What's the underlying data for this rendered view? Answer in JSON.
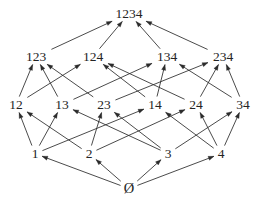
{
  "diagram": {
    "type": "lattice-hasse-diagram",
    "background_color": "#ffffff",
    "line_color": "#2b2b2b",
    "text_color": "#242424",
    "levels": [
      {
        "rank": 4,
        "y": 18
      },
      {
        "rank": 3,
        "y": 61
      },
      {
        "rank": 2,
        "y": 109
      },
      {
        "rank": 1,
        "y": 158
      },
      {
        "rank": 0,
        "y": 193
      }
    ],
    "nodes": [
      {
        "id": "1234",
        "label": "1234",
        "x": 129,
        "y": 18,
        "rank": 4,
        "halfw": 17,
        "icon": "text-label"
      },
      {
        "id": "123",
        "label": "123",
        "x": 36,
        "y": 61,
        "rank": 3,
        "halfw": 13,
        "icon": "text-label"
      },
      {
        "id": "124",
        "label": "124",
        "x": 93,
        "y": 61,
        "rank": 3,
        "halfw": 13,
        "icon": "text-label"
      },
      {
        "id": "134",
        "label": "134",
        "x": 167,
        "y": 61,
        "rank": 3,
        "halfw": 13,
        "icon": "text-label"
      },
      {
        "id": "234",
        "label": "234",
        "x": 223,
        "y": 61,
        "rank": 3,
        "halfw": 13,
        "icon": "text-label"
      },
      {
        "id": "12",
        "label": "12",
        "x": 16,
        "y": 109,
        "rank": 2,
        "halfw": 9,
        "icon": "text-label"
      },
      {
        "id": "13",
        "label": "13",
        "x": 62,
        "y": 109,
        "rank": 2,
        "halfw": 9,
        "icon": "text-label"
      },
      {
        "id": "23",
        "label": "23",
        "x": 104,
        "y": 109,
        "rank": 2,
        "halfw": 9,
        "icon": "text-label"
      },
      {
        "id": "14",
        "label": "14",
        "x": 155,
        "y": 109,
        "rank": 2,
        "halfw": 9,
        "icon": "text-label"
      },
      {
        "id": "24",
        "label": "24",
        "x": 196,
        "y": 109,
        "rank": 2,
        "halfw": 9,
        "icon": "text-label"
      },
      {
        "id": "34",
        "label": "34",
        "x": 243,
        "y": 109,
        "rank": 2,
        "halfw": 9,
        "icon": "text-label"
      },
      {
        "id": "1",
        "label": "1",
        "x": 35,
        "y": 158,
        "rank": 1,
        "halfw": 5,
        "icon": "text-label"
      },
      {
        "id": "2",
        "label": "2",
        "x": 89,
        "y": 158,
        "rank": 1,
        "halfw": 5,
        "icon": "text-label"
      },
      {
        "id": "3",
        "label": "3",
        "x": 168,
        "y": 158,
        "rank": 1,
        "halfw": 5,
        "icon": "text-label"
      },
      {
        "id": "4",
        "label": "4",
        "x": 221,
        "y": 158,
        "rank": 1,
        "halfw": 5,
        "icon": "text-label"
      },
      {
        "id": "empty",
        "label": "Ø",
        "x": 129,
        "y": 193,
        "rank": 0,
        "halfw": 6,
        "icon": "empty-set-symbol"
      }
    ],
    "edges": [
      {
        "from": "123",
        "to": "1234",
        "arrow": "to"
      },
      {
        "from": "124",
        "to": "1234",
        "arrow": "to"
      },
      {
        "from": "134",
        "to": "1234",
        "arrow": "to"
      },
      {
        "from": "234",
        "to": "1234",
        "arrow": "to"
      },
      {
        "from": "12",
        "to": "123",
        "arrow": "to"
      },
      {
        "from": "13",
        "to": "123",
        "arrow": "to"
      },
      {
        "from": "23",
        "to": "123",
        "arrow": "to"
      },
      {
        "from": "12",
        "to": "124",
        "arrow": "to"
      },
      {
        "from": "14",
        "to": "124",
        "arrow": "to"
      },
      {
        "from": "24",
        "to": "124",
        "arrow": "to"
      },
      {
        "from": "13",
        "to": "134",
        "arrow": "to"
      },
      {
        "from": "14",
        "to": "134",
        "arrow": "to"
      },
      {
        "from": "34",
        "to": "134",
        "arrow": "to"
      },
      {
        "from": "23",
        "to": "234",
        "arrow": "to"
      },
      {
        "from": "24",
        "to": "234",
        "arrow": "to"
      },
      {
        "from": "34",
        "to": "234",
        "arrow": "to"
      },
      {
        "from": "1",
        "to": "12",
        "arrow": "to"
      },
      {
        "from": "2",
        "to": "12",
        "arrow": "to"
      },
      {
        "from": "1",
        "to": "13",
        "arrow": "to"
      },
      {
        "from": "3",
        "to": "13",
        "arrow": "to"
      },
      {
        "from": "2",
        "to": "23",
        "arrow": "to"
      },
      {
        "from": "3",
        "to": "23",
        "arrow": "to"
      },
      {
        "from": "1",
        "to": "14",
        "arrow": "to"
      },
      {
        "from": "4",
        "to": "14",
        "arrow": "to"
      },
      {
        "from": "2",
        "to": "24",
        "arrow": "to"
      },
      {
        "from": "4",
        "to": "24",
        "arrow": "to"
      },
      {
        "from": "3",
        "to": "34",
        "arrow": "to"
      },
      {
        "from": "4",
        "to": "34",
        "arrow": "to"
      },
      {
        "from": "empty",
        "to": "1",
        "arrow": "to"
      },
      {
        "from": "empty",
        "to": "2",
        "arrow": "to"
      },
      {
        "from": "empty",
        "to": "3",
        "arrow": "to"
      },
      {
        "from": "empty",
        "to": "4",
        "arrow": "to"
      }
    ]
  }
}
